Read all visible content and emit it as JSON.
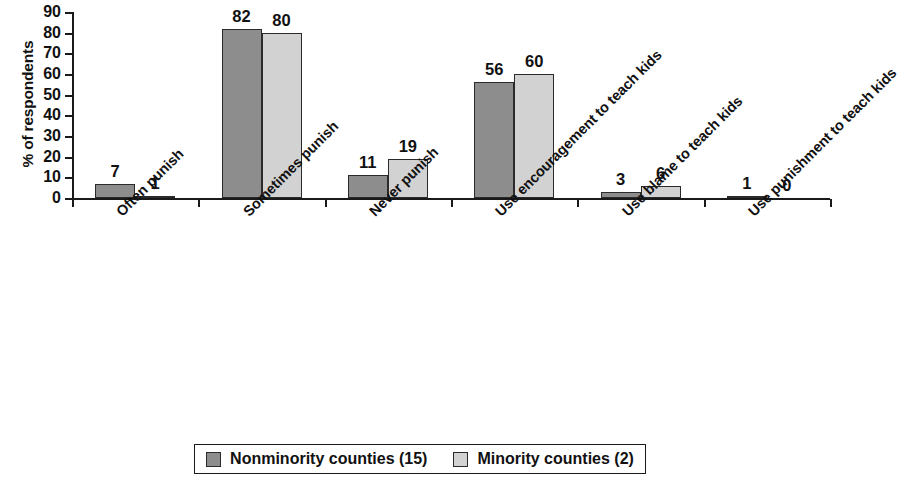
{
  "chart_data": {
    "type": "bar",
    "title": "",
    "xlabel": "",
    "ylabel": "% of respondents",
    "ylim": [
      0,
      90
    ],
    "yticks": [
      0,
      10,
      20,
      30,
      40,
      50,
      60,
      70,
      80,
      90
    ],
    "grid": false,
    "legend_position": "bottom",
    "categories": [
      "Often punish",
      "Sometimes punish",
      "Never punish",
      "Use encouragement to teach kids",
      "Use blame to teach kids",
      "Use punishment to teach kids"
    ],
    "series": [
      {
        "name": "Nonminority counties (15)",
        "color": "#8d8d8d",
        "values": [
          7,
          82,
          11,
          56,
          3,
          1
        ]
      },
      {
        "name": "Minority counties (2)",
        "color": "#d2d2d2",
        "values": [
          1,
          80,
          19,
          60,
          6,
          0
        ]
      }
    ]
  },
  "legend": {
    "items": [
      {
        "label": "Nonminority counties (15)",
        "swatch": "s0"
      },
      {
        "label": "Minority counties (2)",
        "swatch": "s1"
      }
    ]
  }
}
